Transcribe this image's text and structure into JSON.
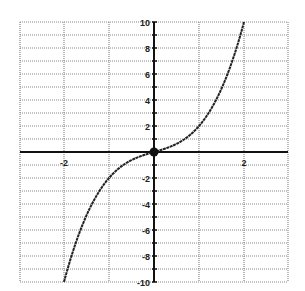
{
  "chart_data": {
    "type": "line",
    "title": "",
    "xlabel": "",
    "ylabel": "",
    "function": "y = x^3 + x",
    "xlim": [
      -2.97,
      2.97
    ],
    "ylim": [
      -10,
      10
    ],
    "grid": true,
    "legend": null,
    "x_gridlines": [
      -2,
      -1,
      0,
      1,
      2
    ],
    "y_gridlines": [
      -10,
      -9,
      -8,
      -7,
      -6,
      -5,
      -4,
      -3,
      -2,
      -1,
      0,
      1,
      2,
      3,
      4,
      5,
      6,
      7,
      8,
      9,
      10
    ],
    "x_tick_labels": [
      {
        "value": -2,
        "label": "-2"
      },
      {
        "value": 2,
        "label": "2"
      }
    ],
    "y_tick_labels": [
      {
        "value": 10,
        "label": "10"
      },
      {
        "value": 8,
        "label": "8"
      },
      {
        "value": 6,
        "label": "6"
      },
      {
        "value": 4,
        "label": "4"
      },
      {
        "value": 2,
        "label": "2"
      },
      {
        "value": -2,
        "label": "-2"
      },
      {
        "value": -4,
        "label": "-4"
      },
      {
        "value": -6,
        "label": "-6"
      },
      {
        "value": -8,
        "label": "-8"
      },
      {
        "value": -10,
        "label": "-10"
      }
    ],
    "series": [
      {
        "name": "curve",
        "x": [
          -2,
          -1.75,
          -1.5,
          -1.25,
          -1,
          -0.75,
          -0.5,
          -0.25,
          0,
          0.25,
          0.5,
          0.75,
          1,
          1.25,
          1.5,
          1.75,
          2
        ],
        "y": [
          -10,
          -7.11,
          -4.88,
          -3.2,
          -2,
          -1.17,
          -0.63,
          -0.27,
          0,
          0.27,
          0.63,
          1.17,
          2,
          3.2,
          4.88,
          7.11,
          10
        ]
      }
    ],
    "annotations": [
      {
        "type": "point",
        "x": 0,
        "y": 0,
        "marker": "filled-circle"
      }
    ]
  },
  "layout": {
    "plot_left": 20,
    "plot_right": 288,
    "plot_top": 22,
    "plot_bottom": 282,
    "origin_x": 154,
    "origin_y": 152,
    "px_per_x": 45,
    "px_per_y": 13
  },
  "colors": {
    "grid": "#8a8a8a",
    "axis": "#111111",
    "curve": "#222222",
    "background": "#ffffff"
  }
}
